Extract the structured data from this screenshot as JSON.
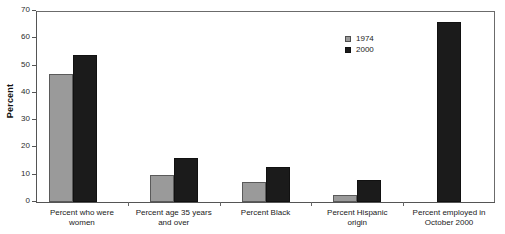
{
  "chart_data": {
    "type": "bar",
    "title": "",
    "subtitle": "",
    "xlabel": "",
    "ylabel": "Percent",
    "ylim": [
      0,
      70
    ],
    "ytick_step": 10,
    "yticks": [
      "0",
      "10",
      "20",
      "30",
      "40",
      "50",
      "60",
      "70"
    ],
    "grid": false,
    "legend_position": "top-right",
    "categories": [
      "Percent who were\nwomen",
      "Percent age 35 years\nand over",
      "Percent Black",
      "Percent Hispanic\norigin",
      "Percent employed in\nOctober 2000"
    ],
    "series": [
      {
        "name": "1974",
        "color": "#9a9a9a",
        "values": [
          47,
          10,
          7.5,
          2.5,
          null
        ]
      },
      {
        "name": "2000",
        "color": "#1b1b1b",
        "values": [
          54,
          16,
          13,
          8,
          66
        ]
      }
    ]
  },
  "legend": {
    "entries": [
      {
        "label": "1974",
        "swatch": "gray-square-swatch"
      },
      {
        "label": "2000",
        "swatch": "black-square-swatch"
      }
    ]
  },
  "axes": {
    "y_title": "Percent"
  }
}
